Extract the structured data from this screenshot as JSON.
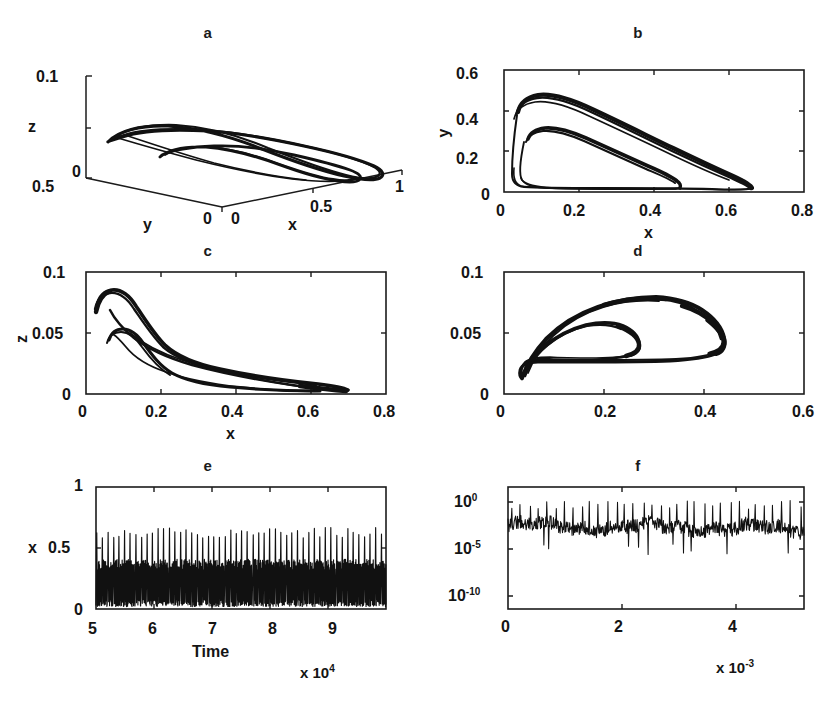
{
  "figure": {
    "kind": "multi-panel-scientific-figure",
    "panel_count": 6,
    "background": "#ffffff",
    "ink_color": "#111111"
  },
  "panels": {
    "a": {
      "letter": "a",
      "type": "3d-phase-portrait",
      "xlabel": "x",
      "ylabel": "y",
      "zlabel": "z",
      "x_ticks": [
        "0",
        "0.5",
        "1"
      ],
      "y_ticks": [
        "0.5",
        "0"
      ],
      "z_ticks": [
        "0",
        "0.1"
      ]
    },
    "b": {
      "letter": "b",
      "type": "phase-projection",
      "xlabel": "x",
      "ylabel": "y",
      "x_ticks": [
        "0",
        "0.2",
        "0.4",
        "0.6",
        "0.8"
      ],
      "y_ticks": [
        "0",
        "0.2",
        "0.4",
        "0.6"
      ]
    },
    "c": {
      "letter": "c",
      "type": "phase-projection",
      "xlabel": "x",
      "ylabel": "z",
      "x_ticks": [
        "0",
        "0.2",
        "0.4",
        "0.6",
        "0.8"
      ],
      "y_ticks": [
        "0",
        "0.05",
        "0.1"
      ]
    },
    "d": {
      "letter": "d",
      "type": "phase-projection",
      "xlabel": "",
      "ylabel": "",
      "x_ticks": [
        "0",
        "0.2",
        "0.4",
        "0.6"
      ],
      "y_ticks": [
        "0",
        "0.05",
        "0.1"
      ]
    },
    "e": {
      "letter": "e",
      "type": "time-series",
      "xlabel": "Time",
      "ylabel": "x",
      "x_ticks": [
        "5",
        "6",
        "7",
        "8",
        "9"
      ],
      "y_ticks": [
        "0",
        "0.5",
        "1"
      ],
      "x_exponent_mantissa": "x 10",
      "x_exponent_power": "4"
    },
    "f": {
      "letter": "f",
      "type": "power-spectrum",
      "xlabel": "",
      "ylabel": "",
      "x_ticks": [
        "0",
        "2",
        "4"
      ],
      "y_ticks": [
        "10",
        "10",
        "10"
      ],
      "y_tick_powers": [
        "0",
        "-5",
        "-10"
      ],
      "x_exponent_mantissa": "x 10",
      "x_exponent_power": "-3"
    }
  },
  "chart_data": [
    {
      "type": "line",
      "panel": "a",
      "title": "a",
      "xlabel": "x",
      "ylabel": "y",
      "zlabel": "z",
      "xlim": [
        0,
        1
      ],
      "ylim": [
        0,
        0.5
      ],
      "zlim": [
        0,
        0.1
      ],
      "grid": false,
      "legend": null,
      "description": "Three-dimensional chaotic attractor drawn as a thin ribbon with two nested folded loops, viewed obliquely over an x-y base plane.",
      "projection": "3d-oblique"
    },
    {
      "type": "line",
      "panel": "b",
      "title": "b",
      "xlabel": "x",
      "ylabel": "y",
      "xlim": [
        0,
        0.8
      ],
      "ylim": [
        0,
        0.6
      ],
      "grid": false,
      "series": [
        {
          "name": "outer-loop",
          "x": [
            0.03,
            0.034,
            0.042,
            0.055,
            0.075,
            0.11,
            0.16,
            0.22,
            0.29,
            0.37,
            0.45,
            0.52,
            0.575,
            0.61,
            0.627,
            0.63,
            0.615,
            0.57,
            0.5,
            0.42,
            0.33,
            0.25,
            0.17,
            0.115,
            0.075,
            0.05,
            0.035,
            0.03
          ],
          "y": [
            0.395,
            0.43,
            0.455,
            0.468,
            0.47,
            0.455,
            0.425,
            0.385,
            0.335,
            0.275,
            0.21,
            0.15,
            0.105,
            0.07,
            0.048,
            0.038,
            0.033,
            0.031,
            0.03,
            0.03,
            0.031,
            0.033,
            0.037,
            0.045,
            0.065,
            0.12,
            0.25,
            0.395
          ]
        },
        {
          "name": "inner-loop",
          "x": [
            0.062,
            0.07,
            0.085,
            0.11,
            0.145,
            0.19,
            0.24,
            0.29,
            0.34,
            0.375,
            0.392,
            0.388,
            0.355,
            0.3,
            0.24,
            0.18,
            0.13,
            0.095,
            0.072,
            0.062
          ],
          "y": [
            0.232,
            0.252,
            0.262,
            0.26,
            0.248,
            0.226,
            0.198,
            0.166,
            0.128,
            0.09,
            0.06,
            0.046,
            0.04,
            0.037,
            0.035,
            0.035,
            0.038,
            0.055,
            0.12,
            0.232
          ]
        }
      ]
    },
    {
      "type": "line",
      "panel": "c",
      "title": "c",
      "xlabel": "x",
      "ylabel": "z",
      "xlim": [
        0,
        0.8
      ],
      "ylim": [
        0,
        0.1
      ],
      "grid": false,
      "series": [
        {
          "name": "outer-loop",
          "x": [
            0.028,
            0.033,
            0.042,
            0.058,
            0.085,
            0.125,
            0.175,
            0.235,
            0.3,
            0.37,
            0.44,
            0.51,
            0.565,
            0.605,
            0.625,
            0.628,
            0.605,
            0.55,
            0.48,
            0.4,
            0.32,
            0.245,
            0.18,
            0.125,
            0.085,
            0.055,
            0.036,
            0.028
          ],
          "z": [
            0.072,
            0.082,
            0.086,
            0.084,
            0.078,
            0.068,
            0.058,
            0.049,
            0.042,
            0.036,
            0.031,
            0.026,
            0.022,
            0.018,
            0.015,
            0.014,
            0.014,
            0.015,
            0.017,
            0.02,
            0.024,
            0.028,
            0.033,
            0.038,
            0.043,
            0.049,
            0.06,
            0.072
          ]
        },
        {
          "name": "inner-loop",
          "x": [
            0.058,
            0.065,
            0.08,
            0.105,
            0.14,
            0.185,
            0.235,
            0.29,
            0.35,
            0.42,
            0.49,
            0.545,
            0.585,
            0.605,
            0.598,
            0.55,
            0.48,
            0.4,
            0.31,
            0.23,
            0.165,
            0.115,
            0.08,
            0.062,
            0.058
          ],
          "z": [
            0.057,
            0.061,
            0.062,
            0.06,
            0.056,
            0.051,
            0.046,
            0.041,
            0.036,
            0.031,
            0.026,
            0.022,
            0.018,
            0.016,
            0.015,
            0.016,
            0.018,
            0.021,
            0.025,
            0.03,
            0.035,
            0.041,
            0.047,
            0.052,
            0.057
          ]
        }
      ]
    },
    {
      "type": "line",
      "panel": "d",
      "title": "d",
      "xlim": [
        0,
        0.6
      ],
      "ylim": [
        0,
        0.1
      ],
      "grid": false,
      "series": [
        {
          "name": "outer-teardrop",
          "x": [
            0.035,
            0.042,
            0.06,
            0.09,
            0.13,
            0.175,
            0.225,
            0.275,
            0.325,
            0.375,
            0.42,
            0.455,
            0.477,
            0.482,
            0.47,
            0.44,
            0.395,
            0.34,
            0.28,
            0.22,
            0.165,
            0.118,
            0.08,
            0.052,
            0.038,
            0.035
          ],
          "z": [
            0.013,
            0.026,
            0.042,
            0.058,
            0.07,
            0.077,
            0.081,
            0.082,
            0.081,
            0.078,
            0.073,
            0.065,
            0.056,
            0.048,
            0.042,
            0.039,
            0.037,
            0.036,
            0.035,
            0.034,
            0.033,
            0.03,
            0.026,
            0.02,
            0.015,
            0.013
          ]
        },
        {
          "name": "inner-teardrop",
          "x": [
            0.04,
            0.05,
            0.07,
            0.1,
            0.135,
            0.172,
            0.21,
            0.245,
            0.268,
            0.272,
            0.258,
            0.23,
            0.195,
            0.158,
            0.122,
            0.09,
            0.065,
            0.048,
            0.04
          ],
          "z": [
            0.018,
            0.03,
            0.043,
            0.053,
            0.059,
            0.061,
            0.06,
            0.056,
            0.051,
            0.047,
            0.044,
            0.042,
            0.041,
            0.04,
            0.038,
            0.035,
            0.03,
            0.023,
            0.018
          ]
        }
      ]
    },
    {
      "type": "line",
      "panel": "e",
      "title": "e",
      "xlabel": "Time",
      "ylabel": "x",
      "xlim": [
        50000,
        100000
      ],
      "ylim": [
        0,
        1
      ],
      "x_scale_factor": 10000,
      "grid": false,
      "description": "Chaotic time series of x: ~52 large spikes reaching 0.58-0.67 separated by a dense band of small-amplitude oscillations between 0 and about 0.4.",
      "spike_count": 52,
      "spike_peak_range": [
        0.58,
        0.67
      ],
      "baseline_band": [
        0.02,
        0.4
      ]
    },
    {
      "type": "line",
      "panel": "f",
      "title": "f",
      "xlim": [
        0,
        0.005
      ],
      "ylim": [
        1e-10,
        10
      ],
      "y_scale": "log",
      "x_scale_factor": 0.001,
      "grid": false,
      "description": "Broadband power spectrum: noisy continuum centred near 1e-3 to 1e-2 with many sharp narrow peaks rising toward 1e0, characteristic of chaos.",
      "continuum_level": 0.003,
      "peak_level": 1.0,
      "peak_count": 34
    }
  ]
}
